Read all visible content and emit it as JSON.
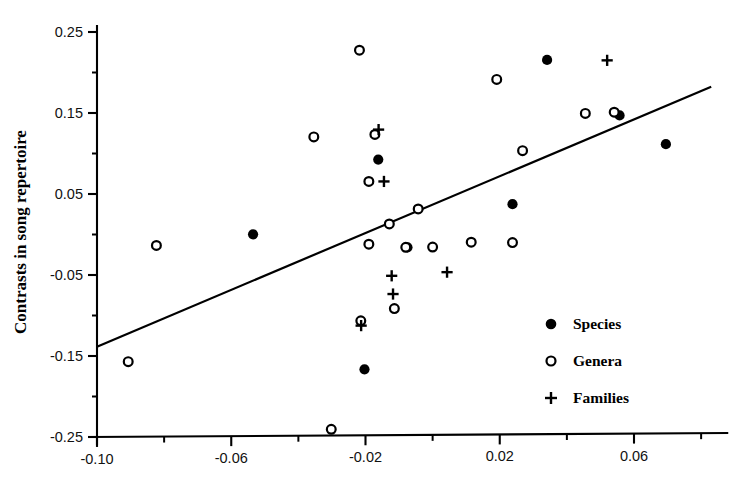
{
  "chart_data": {
    "type": "scatter",
    "title": "",
    "xlabel": "",
    "ylabel": "Contrasts in song repertoire",
    "xlim": [
      -0.105,
      0.0845
    ],
    "ylim": [
      -0.25,
      0.25
    ],
    "grid": false,
    "legend_position": "bottom-right",
    "x_ticks": [
      -0.1,
      -0.06,
      -0.02,
      0.02,
      0.06
    ],
    "x_tick_labels": [
      "-0.10",
      "-0.06",
      "-0.02",
      "0.02",
      "0.06"
    ],
    "x_minor_ticks": [
      -0.08,
      -0.04,
      0.0,
      0.04,
      0.08
    ],
    "y_ticks": [
      0.25,
      0.15,
      0.05,
      -0.05,
      -0.15,
      -0.25
    ],
    "y_tick_labels": [
      "0.25",
      "0.15",
      "0.05",
      "-0.05",
      "-0.15",
      "-0.25"
    ],
    "y_minor_ticks": [
      0.2,
      0.1,
      0.0,
      -0.1,
      -0.2
    ],
    "series": [
      {
        "name": "Species",
        "marker": "filled-circle",
        "color": "#000000",
        "points": [
          {
            "x": -0.0535,
            "y": 0.0002
          },
          {
            "x": -0.0162,
            "y": 0.0925
          },
          {
            "x": -0.0203,
            "y": -0.1665
          },
          {
            "x": -0.0075,
            "y": -0.0158
          },
          {
            "x": 0.0238,
            "y": 0.0375
          },
          {
            "x": 0.0341,
            "y": 0.2155
          },
          {
            "x": 0.0557,
            "y": 0.147
          },
          {
            "x": 0.0695,
            "y": 0.1115
          }
        ]
      },
      {
        "name": "Genera",
        "marker": "open-circle",
        "color": "#000000",
        "points": [
          {
            "x": -0.0907,
            "y": -0.157
          },
          {
            "x": -0.0823,
            "y": -0.0135
          },
          {
            "x": -0.0354,
            "y": 0.1205
          },
          {
            "x": -0.0302,
            "y": -0.2405
          },
          {
            "x": -0.0218,
            "y": 0.2275
          },
          {
            "x": -0.0214,
            "y": -0.1065
          },
          {
            "x": -0.0172,
            "y": 0.1235
          },
          {
            "x": -0.019,
            "y": 0.0655
          },
          {
            "x": -0.019,
            "y": -0.012
          },
          {
            "x": -0.0129,
            "y": 0.013
          },
          {
            "x": -0.0114,
            "y": -0.0915
          },
          {
            "x": -0.008,
            "y": -0.0158
          },
          {
            "x": -0.0043,
            "y": 0.0315
          },
          {
            "x": 0.0,
            "y": -0.0155
          },
          {
            "x": 0.0115,
            "y": -0.0095
          },
          {
            "x": 0.0191,
            "y": 0.1915
          },
          {
            "x": 0.0238,
            "y": -0.01
          },
          {
            "x": 0.0268,
            "y": 0.1035
          },
          {
            "x": 0.0455,
            "y": 0.1495
          },
          {
            "x": 0.0541,
            "y": 0.151
          }
        ]
      },
      {
        "name": "Families",
        "marker": "plus",
        "color": "#000000",
        "points": [
          {
            "x": -0.0213,
            "y": -0.1125
          },
          {
            "x": -0.0161,
            "y": 0.1295
          },
          {
            "x": -0.0145,
            "y": 0.0655
          },
          {
            "x": -0.0122,
            "y": -0.051
          },
          {
            "x": -0.0118,
            "y": -0.0735
          },
          {
            "x": 0.0043,
            "y": -0.0465
          },
          {
            "x": 0.052,
            "y": 0.215
          }
        ]
      }
    ],
    "trend_line": {
      "x_start": -0.1,
      "y_start": -0.1385,
      "x_end": 0.083,
      "y_end": 0.1825
    }
  },
  "legend": {
    "items": [
      {
        "label": "Species",
        "marker": "filled-circle"
      },
      {
        "label": "Genera",
        "marker": "open-circle"
      },
      {
        "label": "Families",
        "marker": "plus"
      }
    ]
  }
}
